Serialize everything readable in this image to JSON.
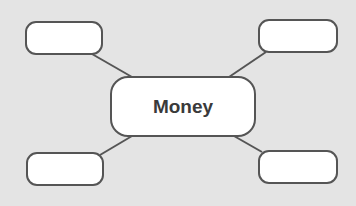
{
  "diagram": {
    "type": "mind-map",
    "center": {
      "label": "Money"
    },
    "branches": [
      {
        "position": "top-left",
        "label": ""
      },
      {
        "position": "top-right",
        "label": ""
      },
      {
        "position": "bottom-left",
        "label": ""
      },
      {
        "position": "bottom-right",
        "label": ""
      }
    ]
  },
  "colors": {
    "background": "#e4e4e4",
    "box_fill": "#ffffff",
    "box_border": "#555555",
    "text": "#3a3a3a"
  }
}
